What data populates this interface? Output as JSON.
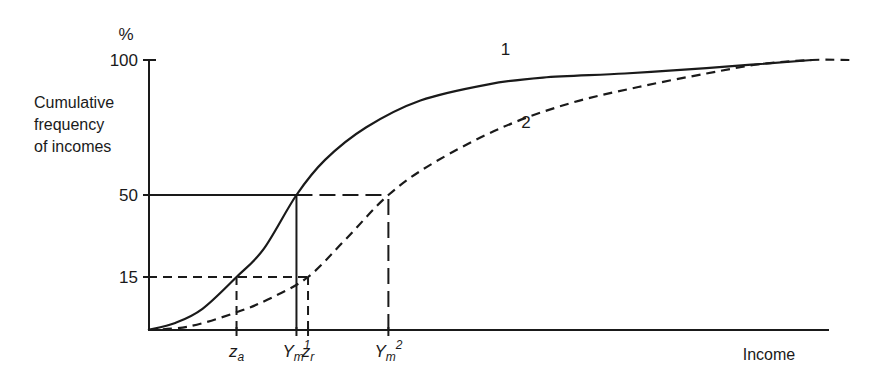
{
  "chart_data": {
    "type": "line",
    "title": "",
    "xlabel": "Income",
    "ylabel": "Cumulative frequency of incomes",
    "y_unit": "%",
    "xlim": [
      0,
      100
    ],
    "ylim": [
      0,
      100
    ],
    "grid": false,
    "y_ticks": [
      {
        "value": 100,
        "label": "100"
      },
      {
        "value": 50,
        "label": "50"
      },
      {
        "value": 15,
        "label": "15"
      }
    ],
    "x_markers": [
      {
        "name": "za",
        "base": "z",
        "sub": "a",
        "sup": "",
        "x": 13.0
      },
      {
        "name": "ym1",
        "base": "Y",
        "sub": "m",
        "sup": "1",
        "x": 21.8
      },
      {
        "name": "zr",
        "base": "z",
        "sub": "r",
        "sup": "",
        "x": 23.5
      },
      {
        "name": "ym2",
        "base": "Y",
        "sub": "m",
        "sup": "2",
        "x": 35.3
      }
    ],
    "series": [
      {
        "name": "1",
        "style": "solid",
        "points": [
          [
            0,
            0
          ],
          [
            4,
            2
          ],
          [
            8,
            6
          ],
          [
            13,
            15
          ],
          [
            17,
            27
          ],
          [
            21.8,
            50
          ],
          [
            26,
            63
          ],
          [
            32,
            75
          ],
          [
            40,
            85
          ],
          [
            50,
            91
          ],
          [
            58,
            93.5
          ],
          [
            70,
            95
          ],
          [
            82,
            97
          ],
          [
            97.5,
            100
          ]
        ]
      },
      {
        "name": "2",
        "style": "dashed",
        "points": [
          [
            0,
            0
          ],
          [
            6,
            1
          ],
          [
            13,
            5
          ],
          [
            18,
            9
          ],
          [
            23.5,
            15
          ],
          [
            29,
            31
          ],
          [
            35.3,
            50
          ],
          [
            42,
            62
          ],
          [
            52,
            75
          ],
          [
            62,
            84
          ],
          [
            72,
            90
          ],
          [
            82,
            95
          ],
          [
            90,
            98.5
          ],
          [
            97.5,
            100
          ],
          [
            103.3,
            100
          ]
        ]
      }
    ],
    "reference_lines": [
      {
        "name": "median-horizontal",
        "style": "solid",
        "from": [
          0,
          50
        ],
        "to": [
          21.8,
          50
        ]
      },
      {
        "name": "median-horizontal-2",
        "style": "long-dash",
        "from": [
          21.8,
          50
        ],
        "to": [
          35.3,
          50
        ]
      },
      {
        "name": "ym1-vertical",
        "style": "solid",
        "from": [
          21.8,
          0
        ],
        "to": [
          21.8,
          50
        ]
      },
      {
        "name": "ym2-vertical",
        "style": "long-dash",
        "from": [
          35.3,
          0
        ],
        "to": [
          35.3,
          50
        ]
      },
      {
        "name": "fifteen-horizontal",
        "style": "dashed",
        "from": [
          0,
          15
        ],
        "to": [
          23.5,
          15
        ]
      },
      {
        "name": "za-vertical",
        "style": "dashed",
        "from": [
          13.0,
          0
        ],
        "to": [
          13.0,
          15
        ]
      },
      {
        "name": "zr-vertical",
        "style": "dashed",
        "from": [
          23.5,
          0
        ],
        "to": [
          23.5,
          15
        ]
      }
    ],
    "annotations": [
      {
        "text": "1",
        "x": 52.5,
        "y": 102
      },
      {
        "text": "2",
        "x": 55.5,
        "y": 75
      }
    ],
    "legend": "none"
  }
}
